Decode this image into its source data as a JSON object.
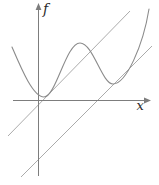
{
  "figure": {
    "background": "#ffffff",
    "axis_color": "#7d7d7d",
    "line_color": "#a2a2a2",
    "curve_color": "#8b8b8b",
    "label_color": "#2b2b2b",
    "x_axis_label": "x",
    "y_axis_label": "f"
  },
  "chart_data": {
    "type": "line",
    "title": "",
    "xlabel": "x",
    "ylabel": "f",
    "grid": false,
    "legend": false,
    "axes": {
      "style": "arrow-tipped axes, no ticks, no tick labels",
      "origin_px": [
        38,
        100
      ],
      "x_axis_extent_px": [
        13,
        150
      ],
      "y_axis_extent_px": [
        3,
        176
      ]
    },
    "series": [
      {
        "name": "f(x)",
        "style": "smooth-curve",
        "description": "wavy function with two local minima and one local maximum, rising steeply at right",
        "points": [
          [
            -26,
            53
          ],
          [
            -10,
            20
          ],
          [
            6,
            3
          ],
          [
            24,
            30
          ],
          [
            42,
            57
          ],
          [
            59,
            37
          ],
          [
            75,
            16
          ],
          [
            94,
            38
          ],
          [
            111,
            91
          ]
        ],
        "local_minima": [
          [
            6,
            3
          ],
          [
            75,
            16
          ]
        ],
        "local_maxima": [
          [
            42,
            57
          ]
        ]
      },
      {
        "name": "upper diagonal line",
        "style": "straight",
        "slope": 1,
        "x_intercept": 4,
        "endpoints": [
          [
            -30,
            -35
          ],
          [
            92,
            89
          ]
        ]
      },
      {
        "name": "lower diagonal line",
        "style": "straight",
        "slope": 1,
        "x_intercept": 59,
        "endpoints": [
          [
            -17,
            -77
          ],
          [
            114,
            54
          ]
        ]
      }
    ],
    "units": "pixels relative to axes origin, y increasing upward"
  },
  "render": {
    "x_axis_path": "M 13 100.5 L 146 100.5",
    "x_arrow_path": "M 151 100.5 L 144 97.6 L 144 103.4 Z",
    "y_axis_path": "M 38.5 176 L 38.5 9",
    "y_arrow_path": "M 38.5 3 L 35.6 10 L 41.4 10 Z",
    "upper_line_path": "M 8 136 L 130 11",
    "lower_line_path": "M 21 177 L 152 46",
    "curve_path": "M 12 47 C 21 68 33 97 44 97 C 56 97 66 43 80 43 C 93 43 102 84 113 84 C 126 84 143 46 149 9"
  }
}
